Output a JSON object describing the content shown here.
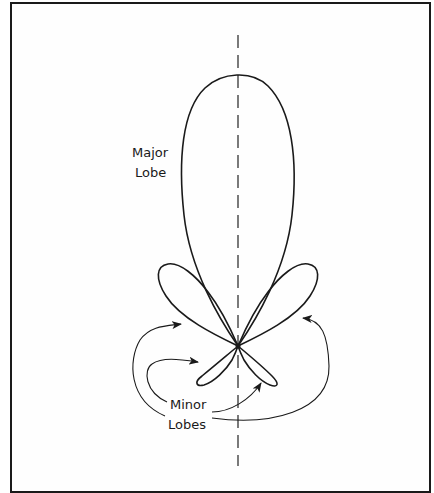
{
  "diagram": {
    "labels": {
      "major_lobe_line1": "Major",
      "major_lobe_line2": "Lobe",
      "minor_lobes_line1": "Minor",
      "minor_lobes_line2": "Lobes"
    },
    "colors": {
      "stroke": "#1a1a1a",
      "background": "#fefefe",
      "border": "#1a1a1a"
    },
    "elements": {
      "axis": "dashed vertical boresight axis",
      "origin": "antenna location at lobe convergence point",
      "major_lobe": "large upward lobe",
      "minor_lobes_upper": "two side lobes angled up-left and up-right",
      "minor_lobes_lower": "two small back lobes angled down-left and down-right",
      "annotation_arrows": 4
    }
  }
}
